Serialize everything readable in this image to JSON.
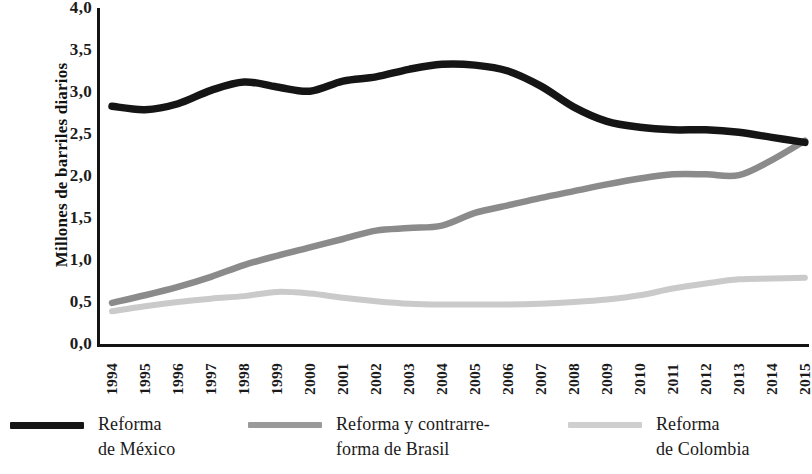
{
  "chart_data": {
    "type": "line",
    "title": "",
    "xlabel": "",
    "ylabel": "Millones de barriles diarios",
    "ylim": [
      0.0,
      4.0
    ],
    "yticks": [
      "0,0",
      "0,5",
      "1,0",
      "1,5",
      "2,0",
      "2,5",
      "3,0",
      "3,5",
      "4,0"
    ],
    "ytick_values": [
      0.0,
      0.5,
      1.0,
      1.5,
      2.0,
      2.5,
      3.0,
      3.5,
      4.0
    ],
    "grid": false,
    "legend_position": "bottom",
    "categories": [
      "1994",
      "1995",
      "1996",
      "1997",
      "1998",
      "1999",
      "2000",
      "2001",
      "2002",
      "2003",
      "2004",
      "2005",
      "2006",
      "2007",
      "2008",
      "2009",
      "2010",
      "2011",
      "2012",
      "2013",
      "2014",
      "2015"
    ],
    "series": [
      {
        "name": "Reforma de México",
        "color": "#151515",
        "values": [
          2.83,
          2.79,
          2.86,
          3.02,
          3.12,
          3.06,
          3.01,
          3.13,
          3.18,
          3.27,
          3.33,
          3.32,
          3.25,
          3.07,
          2.82,
          2.65,
          2.58,
          2.55,
          2.55,
          2.52,
          2.46,
          2.4
        ]
      },
      {
        "name": "Reforma y contrarreforma de Brasil",
        "color": "#8b8b8b",
        "values": [
          0.49,
          0.58,
          0.68,
          0.8,
          0.94,
          1.05,
          1.15,
          1.25,
          1.35,
          1.38,
          1.41,
          1.56,
          1.65,
          1.74,
          1.82,
          1.9,
          1.97,
          2.02,
          2.02,
          2.01,
          2.19,
          2.42
        ]
      },
      {
        "name": "Reforma de Colombia",
        "color": "#cacaca",
        "values": [
          0.39,
          0.45,
          0.5,
          0.54,
          0.57,
          0.62,
          0.6,
          0.55,
          0.51,
          0.48,
          0.47,
          0.47,
          0.47,
          0.48,
          0.5,
          0.53,
          0.58,
          0.66,
          0.72,
          0.77,
          0.78,
          0.79
        ]
      }
    ]
  },
  "axis": {
    "y_title": "Millones de barriles diarios"
  },
  "legend": {
    "items": [
      {
        "label": "Reforma\nde México",
        "color": "#151515",
        "id": "legend-mexico"
      },
      {
        "label": "Reforma y contrarre-\nforma de Brasil",
        "color": "#9a9a9a",
        "id": "legend-brasil"
      },
      {
        "label": "Reforma\nde Colombia",
        "color": "#cfcfcf",
        "id": "legend-colombia"
      }
    ]
  }
}
